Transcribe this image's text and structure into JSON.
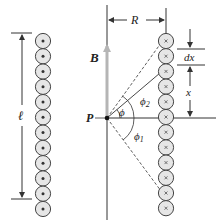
{
  "diagram": {
    "labels": {
      "length": "ℓ",
      "field": "B",
      "point": "P",
      "radius": "R",
      "element_width": "dx",
      "position": "x",
      "angle": "ϕ",
      "angle_2": "ϕ",
      "angle_2_sub": "2",
      "angle_1": "ϕ",
      "angle_1_sub": "1"
    },
    "left_column": {
      "current_direction": "out-of-page (dot)",
      "count": 12
    },
    "right_column": {
      "current_direction": "into-page (cross)",
      "count": 12
    },
    "colors": {
      "line": "#333333",
      "circle_fill": "#e6e6e6",
      "circle_stroke": "#444444",
      "field_arrow": "#b5b5b5"
    }
  }
}
